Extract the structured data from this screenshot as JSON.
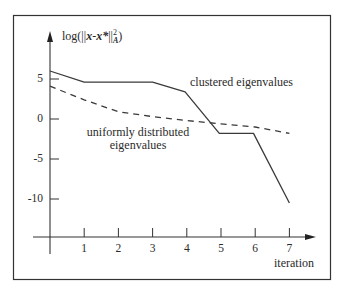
{
  "chart_data": {
    "type": "line",
    "title": "",
    "xlabel": "iteration",
    "ylabel": "log(||x-x*||_A^2)",
    "ylabel_parts": {
      "prefix": "log(||",
      "var1": "x",
      "minus": "-",
      "var2": "x*",
      "close": "||",
      "sup": "2",
      "sub": "A",
      "suffix": ")"
    },
    "x_ticks": [
      "1",
      "2",
      "3",
      "4",
      "5",
      "6",
      "7"
    ],
    "y_ticks": [
      "5",
      "0",
      "-5",
      "-10"
    ],
    "xlim": [
      0,
      7.8
    ],
    "ylim": [
      -13,
      11
    ],
    "grid": false,
    "legend": "inline annotations",
    "series": [
      {
        "name": "clustered eigenvalues",
        "style": "solid",
        "x": [
          0,
          1,
          3,
          3.95,
          4.95,
          5.95,
          7
        ],
        "values": [
          6.0,
          4.6,
          4.6,
          3.4,
          -1.8,
          -1.8,
          -10.5
        ]
      },
      {
        "name": "uniformly distributed eigenvalues",
        "style": "dashed",
        "x": [
          0,
          1,
          2,
          3,
          4,
          5,
          6,
          7
        ],
        "values": [
          4.1,
          2.4,
          0.9,
          0.3,
          -0.2,
          -0.6,
          -1.0,
          -1.8
        ]
      }
    ],
    "annotations": [
      {
        "text": "clustered eigenvalues",
        "x": 5.3,
        "y": 6.6
      },
      {
        "text_lines": [
          "uniformly distributed",
          "eigenvalues"
        ],
        "x": 2.6,
        "y": -2.0
      }
    ]
  }
}
